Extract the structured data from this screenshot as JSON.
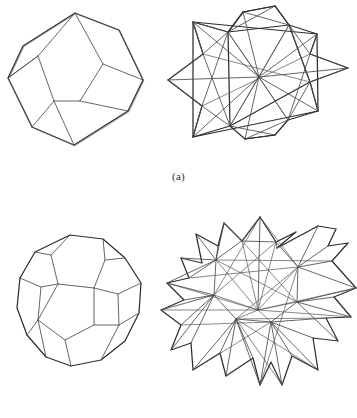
{
  "figure": {
    "background_color": "#ffffff",
    "ink_color": "#2e2e2e",
    "inner_ink_color": "#4a4a4a",
    "panels": [
      {
        "id": "a",
        "label": "(a)",
        "left_figure": {
          "name": "rhombic-dodecahedron",
          "caption_text": ""
        },
        "right_figure": {
          "name": "stellated-rhombic-dodecahedron",
          "caption_text": ""
        }
      },
      {
        "id": "b",
        "label": "(b)",
        "left_figure": {
          "name": "pentagonal-dodecahedron",
          "caption_text": ""
        },
        "right_figure": {
          "name": "stellated-pentagonal-dodecahedron",
          "caption_text": ""
        }
      }
    ]
  },
  "labels": {
    "panel_a": "(a)",
    "panel_b": "(b)"
  }
}
